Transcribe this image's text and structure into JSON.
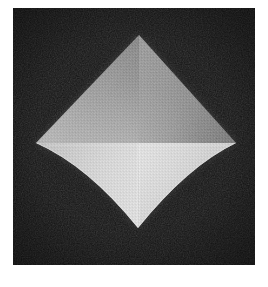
{
  "image": {
    "subject_name": "faceted-diamond-object",
    "description": "Monochrome photograph of a four-faceted kite-shaped object on a black background",
    "canvas": {
      "width": 268,
      "height": 287
    },
    "background_color": "#ffffff"
  },
  "plate": {
    "name": "photograph-plate",
    "left": 13,
    "top": 8,
    "width": 242,
    "height": 257,
    "background_color": "#141414",
    "grain": "film-grain-noise"
  },
  "object": {
    "name": "kite-shaped-faceted-solid",
    "vertices": {
      "top": {
        "x": 139,
        "y": 35
      },
      "left": {
        "x": 36,
        "y": 143
      },
      "right": {
        "x": 236,
        "y": 143
      },
      "bottom": {
        "x": 138,
        "y": 228
      },
      "center": {
        "x": 139,
        "y": 143
      }
    },
    "edges": {
      "upper_left": "straight",
      "upper_right": "straight",
      "lower_left": "concave",
      "lower_right": "concave"
    },
    "facets": [
      {
        "name": "facet-upper-left",
        "fill": "#8e8e8e",
        "highlight": "#b4b4b4",
        "shadow": "#6e6e6e"
      },
      {
        "name": "facet-upper-right",
        "fill": "#848484",
        "highlight": "#a4a4a4",
        "shadow": "#5f5f5f"
      },
      {
        "name": "facet-lower-left",
        "fill": "#d6d6d6",
        "highlight": "#ededed",
        "shadow": "#b0b0b0"
      },
      {
        "name": "facet-lower-right",
        "fill": "#dcdcdc",
        "highlight": "#f0f0f0",
        "shadow": "#b6b6b6"
      }
    ],
    "ridges": [
      {
        "name": "vertical-ridge-upper",
        "from": "top",
        "to": "center",
        "color": "#c8c8c8"
      },
      {
        "name": "vertical-ridge-lower",
        "from": "center",
        "to": "bottom",
        "color": "#f2f2f2"
      },
      {
        "name": "horizontal-seam",
        "from": "left",
        "to": "right",
        "color": "#cdcdcd"
      }
    ]
  }
}
